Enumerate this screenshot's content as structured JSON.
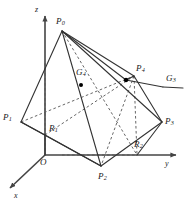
{
  "figure": {
    "kind": "3d-geometry-diagram",
    "stroke_color": "#333333",
    "dashed_color": "#555555",
    "axis_color": "#444444",
    "background": "#ffffff",
    "point_marker_color": "#000000"
  },
  "axes": [
    {
      "id": "x",
      "label": "x",
      "label_x": 14,
      "label_y": 192
    },
    {
      "id": "y",
      "label": "y",
      "label_x": 165,
      "label_y": 160
    },
    {
      "id": "z",
      "label": "z",
      "label_x": 35,
      "label_y": 6
    }
  ],
  "origin": {
    "label": "O",
    "label_x": 40,
    "label_y": 158,
    "x": 45,
    "y": 155
  },
  "vertices": [
    {
      "id": "P0",
      "base": "P",
      "sub": "0",
      "x": 62,
      "y": 31,
      "label_x": 56,
      "label_y": 17
    },
    {
      "id": "P1",
      "base": "P",
      "sub": "1",
      "x": 21,
      "y": 122,
      "label_x": 3,
      "label_y": 113
    },
    {
      "id": "P2",
      "base": "P",
      "sub": "2",
      "x": 101,
      "y": 166,
      "label_x": 98,
      "label_y": 172
    },
    {
      "id": "P3",
      "base": "P",
      "sub": "3",
      "x": 162,
      "y": 122,
      "label_x": 165,
      "label_y": 117
    },
    {
      "id": "P4",
      "base": "P",
      "sub": "4",
      "x": 134,
      "y": 76,
      "label_x": 136,
      "label_y": 64
    },
    {
      "id": "R1",
      "base": "R",
      "sub": "1",
      "x": 45,
      "y": 135,
      "label_x": 49,
      "label_y": 124
    },
    {
      "id": "R2",
      "base": "R",
      "sub": "2",
      "x": 137,
      "y": 155,
      "label_x": 134,
      "label_y": 140
    },
    {
      "id": "G4",
      "base": "G",
      "sub": "4",
      "x": 81,
      "y": 85,
      "label_x": 76,
      "label_y": 68
    },
    {
      "id": "G3",
      "base": "G",
      "sub": "3",
      "x": 126,
      "y": 80,
      "label_x": 166,
      "label_y": 80
    }
  ],
  "markers": [
    {
      "id": "G4-dot",
      "x": 81,
      "y": 85
    },
    {
      "id": "G3-dot",
      "x": 126,
      "y": 80
    }
  ]
}
